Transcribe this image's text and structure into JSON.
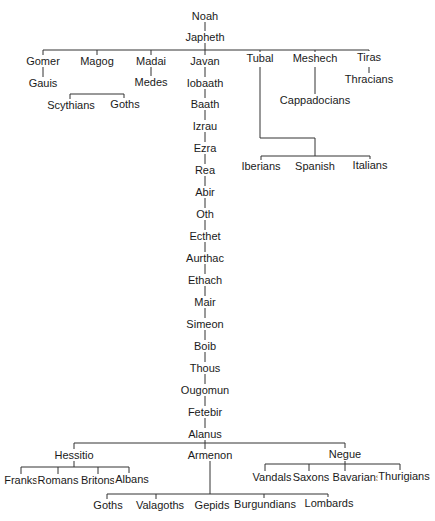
{
  "colors": {
    "line": "#333333",
    "text": "#1a1a1a",
    "background": "#ffffff"
  },
  "nodes": {
    "noah": "Noah",
    "japheth": "Japheth",
    "gomer": "Gomer",
    "magog": "Magog",
    "madai": "Madai",
    "javan": "Javan",
    "tubal": "Tubal",
    "meshech": "Meshech",
    "tiras": "Tiras",
    "gauis": "Gauis",
    "medes": "Medes",
    "thracians": "Thracians",
    "scythians": "Scythians",
    "goths_magog": "Goths",
    "cappadocians": "Cappadocians",
    "iberians": "Iberians",
    "spanish": "Spanish",
    "italians": "Italians",
    "lineage": [
      "Iobaath",
      "Baath",
      "Izrau",
      "Ezra",
      "Rea",
      "Abir",
      "Oth",
      "Ecthet",
      "Aurthac",
      "Ethach",
      "Mair",
      "Simeon",
      "Boib",
      "Thous",
      "Ougomun",
      "Fetebir",
      "Alanus"
    ],
    "hessitio": "Hessitio",
    "armenon": "Armenon",
    "negue": "Negue",
    "franks": "Franks",
    "romans": "Romans",
    "britons": "Britons",
    "albans": "Albans",
    "vandals": "Vandals",
    "saxons": "Saxons",
    "bavarians": "Bavarians",
    "thurigians": "Thurigians",
    "goths_armenon": "Goths",
    "valagoths": "Valagoths",
    "gepids": "Gepids",
    "burgundians": "Burgundians",
    "lombards": "Lombards"
  }
}
